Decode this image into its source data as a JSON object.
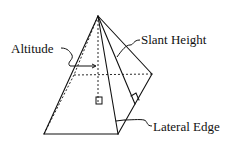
{
  "diagram": {
    "labels": {
      "altitude": "Altitude",
      "slant_height": "Slant Height",
      "lateral_edge": "Lateral Edge"
    },
    "colors": {
      "line": "#111111",
      "background": "#ffffff"
    }
  }
}
